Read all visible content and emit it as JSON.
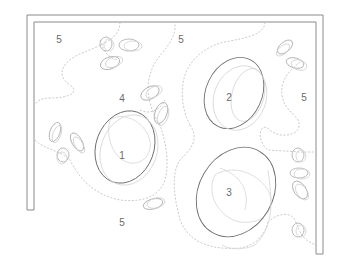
{
  "diagram": {
    "type": "floor-plan zoning sketch",
    "colors": {
      "wall": "#8a8a8a",
      "zone_outline": "#6e6e6e",
      "dashed_path": "#c4c4c4",
      "label": "#6a6a6a"
    },
    "labels": [
      {
        "id": "zone-1",
        "text": "1",
        "x": 122,
        "y": 155
      },
      {
        "id": "zone-2",
        "text": "2",
        "x": 229,
        "y": 97
      },
      {
        "id": "zone-3",
        "text": "3",
        "x": 229,
        "y": 192
      },
      {
        "id": "zone-4",
        "text": "4",
        "x": 122,
        "y": 98
      },
      {
        "id": "zone-5-top-left",
        "text": "5",
        "x": 59,
        "y": 39
      },
      {
        "id": "zone-5-top-center",
        "text": "5",
        "x": 181,
        "y": 39
      },
      {
        "id": "zone-5-right",
        "text": "5",
        "x": 304,
        "y": 97
      },
      {
        "id": "zone-5-bottom",
        "text": "5",
        "x": 122,
        "y": 222
      }
    ]
  }
}
